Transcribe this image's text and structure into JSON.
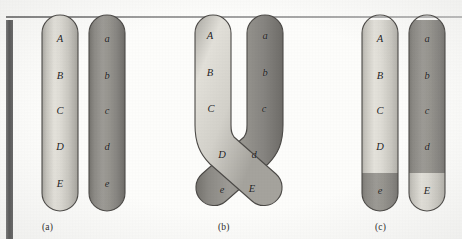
{
  "figure": {
    "background_color": "#fdfdfb",
    "light_chromatid_color": "#d6d4cd",
    "dark_chromatid_color": "#8f8d88",
    "outline_color": "#4c4a47",
    "label_color": "#1d1d1d"
  },
  "panels": [
    {
      "id": "a",
      "caption": "(a)",
      "description": "Two paired homologous chromatids side by side before crossing over",
      "chromatids": [
        {
          "id": "a-light",
          "shade": "light",
          "color": "#d6d4cd",
          "genes": [
            "A",
            "B",
            "C",
            "D",
            "E"
          ]
        },
        {
          "id": "a-dark",
          "shade": "dark",
          "color": "#8f8d88",
          "genes": [
            "a",
            "b",
            "c",
            "d",
            "e"
          ]
        }
      ]
    },
    {
      "id": "b",
      "caption": "(b)",
      "description": "Chromatids crossed at a chiasma forming an X below the C/c region",
      "chromatids": [
        {
          "id": "b-light",
          "shade": "light",
          "color": "#d6d4cd",
          "genes": [
            "A",
            "B",
            "C",
            "D",
            "E"
          ]
        },
        {
          "id": "b-dark",
          "shade": "dark",
          "color": "#8f8d88",
          "genes": [
            "a",
            "b",
            "c",
            "d",
            "e"
          ]
        }
      ]
    },
    {
      "id": "c",
      "caption": "(c)",
      "description": "Recombinant chromatids after crossing over; distal segments exchanged",
      "chromatids": [
        {
          "id": "c-recombinant-left",
          "shade": "light-with-dark-tip",
          "color": "#d6d4cd",
          "tip_color": "#8f8d88",
          "genes": [
            "A",
            "B",
            "C",
            "D",
            "e"
          ]
        },
        {
          "id": "c-recombinant-right",
          "shade": "dark-with-light-tip",
          "color": "#8f8d88",
          "tip_color": "#d6d4cd",
          "genes": [
            "a",
            "b",
            "c",
            "d",
            "E"
          ]
        }
      ]
    }
  ],
  "gene_labels": {
    "panel_a_light": [
      {
        "text": "A",
        "x": 60,
        "y": 40
      },
      {
        "text": "B",
        "x": 60,
        "y": 77
      },
      {
        "text": "C",
        "x": 60,
        "y": 112
      },
      {
        "text": "D",
        "x": 60,
        "y": 148
      },
      {
        "text": "E",
        "x": 60,
        "y": 185
      }
    ],
    "panel_a_dark": [
      {
        "text": "a",
        "x": 107,
        "y": 40
      },
      {
        "text": "b",
        "x": 107,
        "y": 77
      },
      {
        "text": "c",
        "x": 107,
        "y": 112
      },
      {
        "text": "d",
        "x": 107,
        "y": 148
      },
      {
        "text": "e",
        "x": 107,
        "y": 185
      }
    ],
    "panel_b_light": [
      {
        "text": "A",
        "x": 210,
        "y": 37
      },
      {
        "text": "B",
        "x": 210,
        "y": 74
      },
      {
        "text": "C",
        "x": 211,
        "y": 110
      },
      {
        "text": "D",
        "x": 222,
        "y": 156
      },
      {
        "text": "E",
        "x": 252,
        "y": 190
      }
    ],
    "panel_b_dark": [
      {
        "text": "a",
        "x": 265,
        "y": 37
      },
      {
        "text": "b",
        "x": 265,
        "y": 74
      },
      {
        "text": "c",
        "x": 264,
        "y": 110
      },
      {
        "text": "d",
        "x": 254,
        "y": 156
      },
      {
        "text": "e",
        "x": 222,
        "y": 191
      }
    ],
    "panel_c_light": [
      {
        "text": "A",
        "x": 380,
        "y": 40
      },
      {
        "text": "B",
        "x": 380,
        "y": 77
      },
      {
        "text": "C",
        "x": 380,
        "y": 112
      },
      {
        "text": "D",
        "x": 380,
        "y": 148
      },
      {
        "text": "e",
        "x": 380,
        "y": 192
      }
    ],
    "panel_c_dark": [
      {
        "text": "a",
        "x": 427,
        "y": 40
      },
      {
        "text": "b",
        "x": 427,
        "y": 77
      },
      {
        "text": "c",
        "x": 427,
        "y": 112
      },
      {
        "text": "d",
        "x": 427,
        "y": 148
      },
      {
        "text": "E",
        "x": 427,
        "y": 192
      }
    ]
  },
  "captions": [
    {
      "text": "(a)",
      "x": 42,
      "y": 222
    },
    {
      "text": "(b)",
      "x": 218,
      "y": 222
    },
    {
      "text": "(c)",
      "x": 375,
      "y": 222
    }
  ]
}
